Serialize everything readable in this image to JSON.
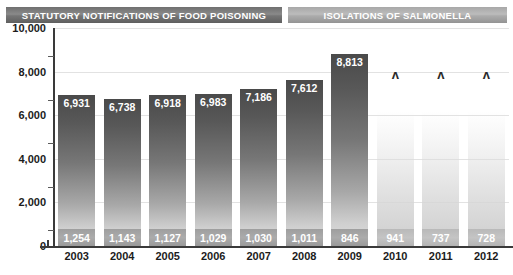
{
  "bleed": {
    "text": " "
  },
  "banners": {
    "food_poisoning": "STATUTORY NOTIFICATIONS OF FOOD POISONING",
    "salmonella": "ISOLATIONS OF SALMONELLA"
  },
  "colors": {
    "banner_food_bg": "#767676",
    "banner_salmonella_bg": "#acacac",
    "bar_top": "#4a4a4a",
    "bar_bottom": "#e0e0e0",
    "band": "#a0a0a0",
    "gridline": "#e2e2e2",
    "axis": "#3a3a3a",
    "text": "#1c1c1c",
    "label_text": "#ffffff"
  },
  "axis": {
    "y_ticks": [
      "0",
      "2,000",
      "4,000",
      "6,000",
      "8,000",
      "10,000"
    ],
    "y_tick_values": [
      0,
      2000,
      4000,
      6000,
      8000,
      10000
    ],
    "x_ticks": [
      "2003",
      "2004",
      "2005",
      "2006",
      "2007",
      "2008",
      "2009",
      "2010",
      "2011",
      "2012"
    ]
  },
  "markers": {
    "unavailable_symbol": "ʌ",
    "unavailable_years": [
      "2010",
      "2011",
      "2012"
    ]
  },
  "chart_data": {
    "type": "bar",
    "title": "",
    "xlabel": "",
    "ylabel": "",
    "ylim": [
      0,
      10000
    ],
    "grid": true,
    "legend_position": "top",
    "categories": [
      "2003",
      "2004",
      "2005",
      "2006",
      "2007",
      "2008",
      "2009",
      "2010",
      "2011",
      "2012"
    ],
    "series": [
      {
        "name": "STATUTORY NOTIFICATIONS OF FOOD POISONING",
        "values": [
          6931,
          6738,
          6918,
          6983,
          7186,
          7612,
          8813,
          null,
          null,
          null
        ],
        "labels": [
          "6,931",
          "6,738",
          "6,918",
          "6,983",
          "7,186",
          "7,612",
          "8,813",
          "ʌ",
          "ʌ",
          "ʌ"
        ]
      },
      {
        "name": "ISOLATIONS OF SALMONELLA",
        "values": [
          1254,
          1143,
          1127,
          1029,
          1030,
          1011,
          846,
          941,
          737,
          728
        ],
        "labels": [
          "1,254",
          "1,143",
          "1,127",
          "1,029",
          "1,030",
          "1,011",
          "846",
          "941",
          "737",
          "728"
        ]
      }
    ]
  }
}
